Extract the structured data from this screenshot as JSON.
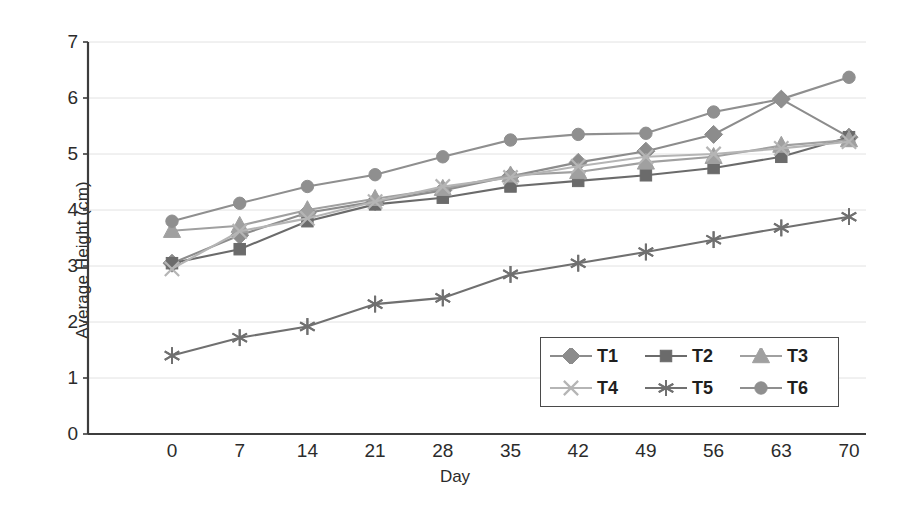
{
  "chart_data": {
    "type": "line",
    "title": "",
    "xlabel": "Day",
    "ylabel": "Average Height (cm)",
    "x": [
      0,
      7,
      14,
      21,
      28,
      35,
      42,
      49,
      56,
      63,
      70
    ],
    "categories": [
      "0",
      "7",
      "14",
      "21",
      "28",
      "35",
      "42",
      "49",
      "56",
      "63",
      "70"
    ],
    "xlim": [
      0,
      70
    ],
    "ylim": [
      0,
      7
    ],
    "yticks": [
      0,
      1,
      2,
      3,
      4,
      5,
      6,
      7
    ],
    "ytick_labels": [
      "0",
      "1",
      "2",
      "3",
      "4",
      "5",
      "6",
      "7"
    ],
    "grid": "horizontal",
    "legend_position": "inside-bottom-right",
    "series": [
      {
        "name": "T1",
        "marker": "diamond",
        "color": "#8c8c8c",
        "values": [
          3.05,
          3.55,
          3.95,
          4.15,
          4.35,
          4.6,
          4.85,
          5.05,
          5.35,
          5.98,
          5.3
        ]
      },
      {
        "name": "T2",
        "marker": "square",
        "color": "#6b6b6b",
        "values": [
          3.05,
          3.3,
          3.8,
          4.1,
          4.22,
          4.42,
          4.52,
          4.62,
          4.75,
          4.95,
          5.3
        ]
      },
      {
        "name": "T3",
        "marker": "triangle",
        "color": "#a0a0a0",
        "values": [
          3.63,
          3.72,
          4.0,
          4.2,
          4.38,
          4.62,
          4.68,
          4.85,
          4.95,
          5.15,
          5.25
        ]
      },
      {
        "name": "T4",
        "marker": "x",
        "color": "#b5b5b5",
        "values": [
          2.95,
          3.62,
          3.85,
          4.15,
          4.42,
          4.58,
          4.78,
          4.95,
          5.0,
          5.1,
          5.22
        ]
      },
      {
        "name": "T5",
        "marker": "asterisk",
        "color": "#707070",
        "values": [
          1.4,
          1.72,
          1.92,
          2.32,
          2.43,
          2.85,
          3.05,
          3.25,
          3.47,
          3.68,
          3.88
        ]
      },
      {
        "name": "T6",
        "marker": "circle",
        "color": "#8f8f8f",
        "values": [
          3.8,
          4.12,
          4.42,
          4.63,
          4.95,
          5.25,
          5.35,
          5.37,
          5.75,
          5.98,
          6.37
        ]
      }
    ]
  },
  "legend": {
    "items": [
      {
        "label": "T1"
      },
      {
        "label": "T2"
      },
      {
        "label": "T3"
      },
      {
        "label": "T4"
      },
      {
        "label": "T5"
      },
      {
        "label": "T6"
      }
    ]
  },
  "colors": {
    "axis": "#3d3d3d",
    "grid": "#e2e2e2",
    "text": "#2b2b2b",
    "background": "#ffffff"
  }
}
